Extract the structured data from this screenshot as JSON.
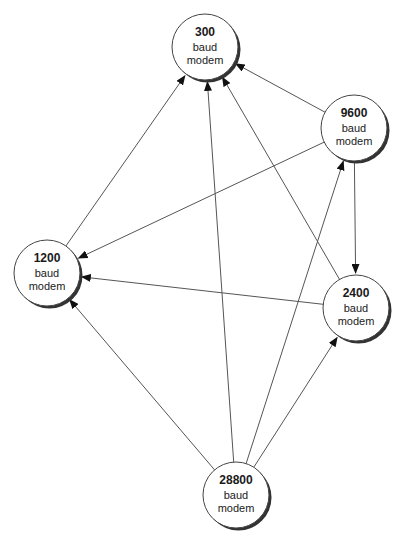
{
  "diagram": {
    "type": "directed-graph",
    "nodes": [
      {
        "id": "300",
        "number": "300",
        "line1": "baud",
        "line2": "modem"
      },
      {
        "id": "9600",
        "number": "9600",
        "line1": "baud",
        "line2": "modem"
      },
      {
        "id": "1200",
        "number": "1200",
        "line1": "baud",
        "line2": "modem"
      },
      {
        "id": "2400",
        "number": "2400",
        "line1": "baud",
        "line2": "modem"
      },
      {
        "id": "28800",
        "number": "28800",
        "line1": "baud",
        "line2": "modem"
      }
    ],
    "edges": [
      {
        "from": "1200",
        "to": "300"
      },
      {
        "from": "28800",
        "to": "300"
      },
      {
        "from": "2400",
        "to": "300"
      },
      {
        "from": "9600",
        "to": "300"
      },
      {
        "from": "9600",
        "to": "1200"
      },
      {
        "from": "9600",
        "to": "2400"
      },
      {
        "from": "2400",
        "to": "1200"
      },
      {
        "from": "28800",
        "to": "1200"
      },
      {
        "from": "28800",
        "to": "9600"
      },
      {
        "from": "28800",
        "to": "2400"
      }
    ],
    "colors": {
      "edge": "#555555",
      "node_fill": "#ffffff",
      "node_stroke": "#444444",
      "node_shadow": "#333333",
      "text": "#1a1a1a"
    }
  }
}
